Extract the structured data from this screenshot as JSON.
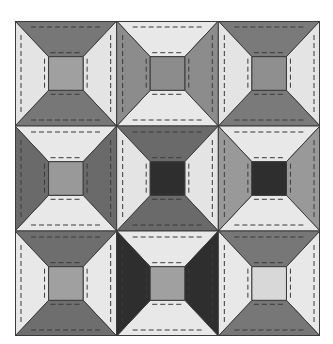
{
  "grid": {
    "rows": 3,
    "cols": 3
  },
  "colors": {
    "outline": "#3a3a3a",
    "stitch": "#3a3a3a"
  },
  "blocks": [
    {
      "row": 0,
      "col": 0,
      "top": "#777777",
      "right": "#e4e4e4",
      "bottom": "#777777",
      "left": "#e4e4e4",
      "center": "#a0a0a0"
    },
    {
      "row": 0,
      "col": 1,
      "top": "#e8e8e8",
      "right": "#8c8c8c",
      "bottom": "#e8e8e8",
      "left": "#8c8c8c",
      "center": "#8c8c8c"
    },
    {
      "row": 0,
      "col": 2,
      "top": "#7a7a7a",
      "right": "#e4e4e4",
      "bottom": "#7a7a7a",
      "left": "#e4e4e4",
      "center": "#8f8f8f"
    },
    {
      "row": 1,
      "col": 0,
      "top": "#e8e8e8",
      "right": "#6a6a6a",
      "bottom": "#e8e8e8",
      "left": "#6a6a6a",
      "center": "#999999"
    },
    {
      "row": 1,
      "col": 1,
      "top": "#6a6a6a",
      "right": "#e4e4e4",
      "bottom": "#6a6a6a",
      "left": "#e4e4e4",
      "center": "#2e2e2e"
    },
    {
      "row": 1,
      "col": 2,
      "top": "#e8e8e8",
      "right": "#999999",
      "bottom": "#e8e8e8",
      "left": "#999999",
      "center": "#2e2e2e"
    },
    {
      "row": 2,
      "col": 0,
      "top": "#6e6e6e",
      "right": "#e8e8e8",
      "bottom": "#6e6e6e",
      "left": "#e8e8e8",
      "center": "#a0a0a0"
    },
    {
      "row": 2,
      "col": 1,
      "top": "#e8e8e8",
      "right": "#2e2e2e",
      "bottom": "#e8e8e8",
      "left": "#2e2e2e",
      "center": "#a0a0a0"
    },
    {
      "row": 2,
      "col": 2,
      "top": "#777777",
      "right": "#e8e8e8",
      "bottom": "#777777",
      "left": "#e8e8e8",
      "center": "#d8d8d8"
    }
  ]
}
